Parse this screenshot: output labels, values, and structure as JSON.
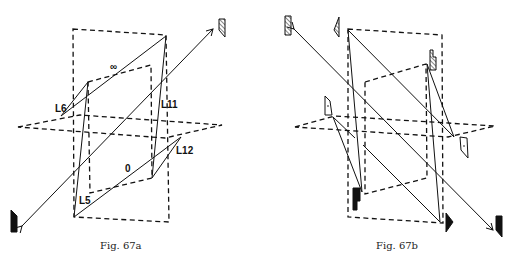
{
  "figures": [
    {
      "id": "67a",
      "caption": "Fig. 67a",
      "labels": {
        "infinity": "∞",
        "zero": "0",
        "L5": "L5",
        "L6": "L6",
        "L11": "L11",
        "L12": "L12"
      },
      "icons": [
        "hatched-prism-icon",
        "solid-prism-icon"
      ]
    },
    {
      "id": "67b",
      "caption": "Fig. 67b",
      "icons": [
        "hatched-prism-icon",
        "hatched-prism-icon",
        "hatched-prism-icon",
        "dotted-prism-icon",
        "dotted-prism-icon",
        "solid-prism-icon",
        "solid-prism-icon",
        "solid-prism-icon"
      ]
    }
  ],
  "colors": {
    "ink": "#111111",
    "background": "#ffffff"
  }
}
